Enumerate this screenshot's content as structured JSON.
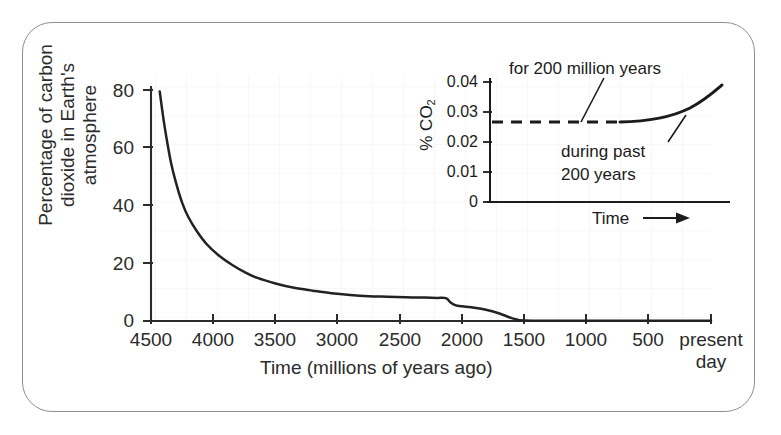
{
  "figure": {
    "background": "#ffffff",
    "frame_color": "#8b8f93",
    "line_color": "#222222",
    "grid_color": "#f1f1f4"
  },
  "chart_data": [
    {
      "id": "main",
      "type": "line",
      "title": "",
      "xlabel": "Time (millions of years ago)",
      "ylabel": "Percentage of carbon\ndioxide in Earth's\natmosphere",
      "xticks": [
        "4500",
        "4000",
        "3500",
        "3000",
        "2500",
        "2000",
        "1500",
        "1000",
        "500",
        "present\nday"
      ],
      "xtick_values": [
        4500,
        4000,
        3500,
        3000,
        2500,
        2000,
        1500,
        1000,
        500,
        0
      ],
      "yticks": [
        "0",
        "20",
        "40",
        "60",
        "80"
      ],
      "ytick_values": [
        0,
        20,
        40,
        60,
        80
      ],
      "xlim": [
        4500,
        0
      ],
      "ylim": [
        0,
        85
      ],
      "x_axis_direction": "decreasing",
      "grid": true,
      "legend": "none",
      "series": [
        {
          "name": "Percentage of carbon dioxide in Earth's atmosphere",
          "points": [
            [
              4430,
              79.5
            ],
            [
              4400,
              70.0
            ],
            [
              4370,
              62.0
            ],
            [
              4340,
              55.0
            ],
            [
              4300,
              48.0
            ],
            [
              4250,
              41.0
            ],
            [
              4200,
              36.0
            ],
            [
              4130,
              31.0
            ],
            [
              4050,
              26.5
            ],
            [
              3950,
              22.5
            ],
            [
              3850,
              19.5
            ],
            [
              3750,
              17.0
            ],
            [
              3650,
              15.0
            ],
            [
              3500,
              13.0
            ],
            [
              3350,
              11.5
            ],
            [
              3200,
              10.5
            ],
            [
              3050,
              9.6
            ],
            [
              2900,
              9.0
            ],
            [
              2750,
              8.6
            ],
            [
              2600,
              8.4
            ],
            [
              2450,
              8.2
            ],
            [
              2300,
              8.1
            ],
            [
              2200,
              8.0
            ],
            [
              2130,
              7.9
            ],
            [
              2090,
              6.3
            ],
            [
              2050,
              5.4
            ],
            [
              2000,
              5.1
            ],
            [
              1900,
              4.6
            ],
            [
              1800,
              3.8
            ],
            [
              1700,
              2.6
            ],
            [
              1620,
              1.3
            ],
            [
              1560,
              0.5
            ],
            [
              1500,
              0.2
            ],
            [
              1200,
              0.1
            ],
            [
              800,
              0.1
            ],
            [
              400,
              0.1
            ],
            [
              0,
              0.1
            ]
          ]
        }
      ]
    },
    {
      "id": "inset",
      "type": "line",
      "title": "",
      "xlabel": "Time",
      "ylabel": "% CO2",
      "ylabel_html": "% CO<sub>2</sub>",
      "yticks": [
        "0",
        "0.01",
        "0.02",
        "0.03",
        "0.04"
      ],
      "ytick_values": [
        0,
        0.01,
        0.02,
        0.03,
        0.04
      ],
      "ylim": [
        0,
        0.042
      ],
      "xlim": [
        0,
        1
      ],
      "grid": false,
      "legend": "none",
      "x_arrow": true,
      "annotations": [
        {
          "name": "for-200-million-years",
          "text": "for 200 million years",
          "target": "dashed plateau segment"
        },
        {
          "name": "during-past-200-years",
          "text": "during past\n200 years",
          "target": "rising solid curve"
        }
      ],
      "series": [
        {
          "name": "for 200 million years",
          "style": "dashed",
          "points": [
            [
              0.0,
              0.0272
            ],
            [
              0.55,
              0.0272
            ]
          ]
        },
        {
          "name": "during past 200 years",
          "style": "solid",
          "points": [
            [
              0.55,
              0.0272
            ],
            [
              0.62,
              0.0274
            ],
            [
              0.69,
              0.0279
            ],
            [
              0.76,
              0.0287
            ],
            [
              0.83,
              0.03
            ],
            [
              0.9,
              0.0318
            ],
            [
              0.97,
              0.034
            ]
          ]
        }
      ]
    }
  ],
  "main": {
    "yaxis_title": "Percentage of carbon\ndioxide in Earth's\natmosphere",
    "xaxis_title": "Time (millions of years ago)",
    "yticks": [
      "80",
      "60",
      "40",
      "20",
      "0"
    ],
    "xticks": [
      "4500",
      "4000",
      "3500",
      "3000",
      "2500",
      "2000",
      "1500",
      "1000",
      "500"
    ],
    "xtick_last_line1": "present",
    "xtick_last_line2": "day"
  },
  "inset": {
    "yaxis_title_prefix": "% CO",
    "yaxis_title_sub": "2",
    "yticks": [
      "0.04",
      "0.03",
      "0.02",
      "0.01",
      "0"
    ],
    "xaxis_title": "Time",
    "annotation_top": "for 200 million years",
    "annotation_bottom": "during past\n200 years"
  }
}
